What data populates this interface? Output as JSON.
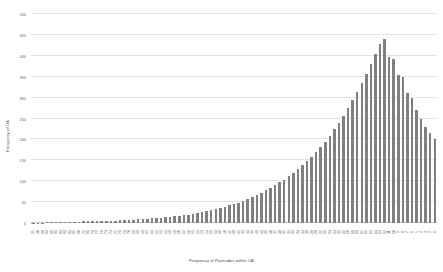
{
  "chart_data": {
    "type": "bar",
    "title": "",
    "xlabel": "Frequency of Postcodes within OA",
    "ylabel": "Frequency of OA",
    "ylim": [
      0,
      500
    ],
    "ytick_values": [
      0,
      50,
      100,
      150,
      200,
      250,
      300,
      350,
      400,
      450,
      500
    ],
    "ytick_labels": [
      "0",
      "50",
      "100",
      "150",
      "200",
      "250",
      "300",
      "350",
      "400",
      "450",
      "500"
    ],
    "grid": true,
    "legend": false,
    "bar_color": "#808080",
    "grid_color": "#e3e3e3",
    "axis_color": "#bdbdbd",
    "background": "#ffffff",
    "categories": [
      "25",
      "30",
      "98",
      "93",
      "91",
      "86",
      "89",
      "83",
      "82",
      "85",
      "80",
      "76",
      "81",
      "79",
      "77",
      "78",
      "74",
      "73",
      "75",
      "71",
      "72",
      "70",
      "68",
      "69",
      "66",
      "67",
      "64",
      "65",
      "62",
      "63",
      "61",
      "59",
      "60",
      "57",
      "58",
      "55",
      "56",
      "53",
      "54",
      "51",
      "52",
      "49",
      "50",
      "47",
      "48",
      "45",
      "46",
      "43",
      "44",
      "41",
      "42",
      "39",
      "40",
      "37",
      "38",
      "35",
      "36",
      "33",
      "34",
      "32",
      "31",
      "29",
      "28",
      "27",
      "26",
      "24",
      "23",
      "22",
      "21",
      "20",
      "19",
      "18",
      "17",
      "16",
      "15",
      "14",
      "13",
      "12",
      "11",
      "10",
      "9",
      "8",
      "7",
      "6",
      "5",
      "4",
      "3",
      "2",
      "1"
    ],
    "values": [
      1,
      1,
      1,
      2,
      2,
      2,
      2,
      3,
      3,
      3,
      3,
      4,
      4,
      4,
      5,
      5,
      5,
      6,
      6,
      7,
      7,
      8,
      8,
      9,
      10,
      10,
      11,
      12,
      13,
      14,
      15,
      16,
      17,
      19,
      20,
      22,
      24,
      26,
      28,
      30,
      33,
      36,
      39,
      42,
      45,
      49,
      53,
      57,
      62,
      67,
      72,
      78,
      84,
      90,
      97,
      104,
      112,
      120,
      129,
      138,
      148,
      159,
      170,
      182,
      195,
      209,
      224,
      240,
      257,
      275,
      294,
      314,
      335,
      357,
      380,
      404,
      429,
      440,
      396,
      392,
      355,
      350,
      310,
      300,
      270,
      250,
      230,
      215,
      200
    ]
  }
}
